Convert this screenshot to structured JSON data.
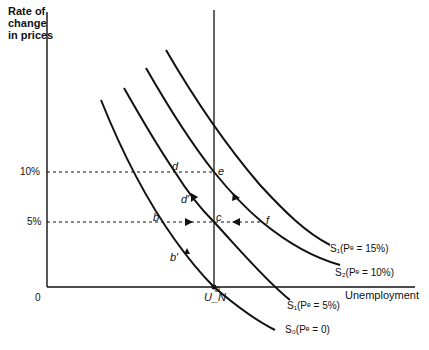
{
  "axes": {
    "y_label": "Rate of\nchange\nin prices",
    "x_label": "Unemployment",
    "origin": "0",
    "y_ticks": [
      "10%",
      "5%"
    ],
    "natural_rate_label": "U_N"
  },
  "curves": [
    {
      "id": "S0",
      "label": "S₀(Pᵉ = 0)",
      "expected_inflation": "0"
    },
    {
      "id": "S1",
      "label": "S₁(Pᵉ = 5%)",
      "expected_inflation": "5%"
    },
    {
      "id": "S2",
      "label": "S₂(Pᵉ = 10%)",
      "expected_inflation": "10%"
    },
    {
      "id": "S3",
      "label": "S₁(Pᵉ = 15%)",
      "expected_inflation": "15%"
    }
  ],
  "points": {
    "a": "a",
    "b": "b",
    "b_prime": "b′",
    "c": "c",
    "d": "d",
    "d_prime": "d′",
    "e": "e",
    "f": "f"
  },
  "colors": {
    "line": "#111111",
    "background": "#ffffff"
  }
}
